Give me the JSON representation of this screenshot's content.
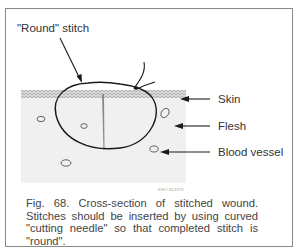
{
  "figure": {
    "labels": {
      "stitch": "\"Round\" stitch",
      "skin": "Skin",
      "flesh": "Flesh",
      "vessel": "Blood vessel"
    },
    "code": "KHO 851875",
    "caption": "Fig. 68. Cross-section of stitched wound. Stitches should be inserted by using curved \"cutting needle\" so that completed stitch is \"round\"."
  }
}
